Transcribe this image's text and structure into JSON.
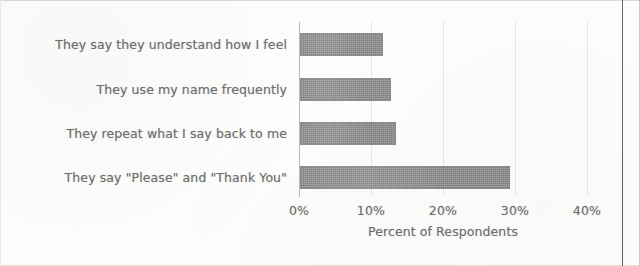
{
  "chart_data": {
    "type": "bar",
    "orientation": "horizontal",
    "title": "",
    "xlabel": "Percent of Respondents",
    "ylabel": "",
    "xlim": [
      0,
      40
    ],
    "xticks": [
      0,
      10,
      20,
      30,
      40
    ],
    "xtick_labels": [
      "0%",
      "10%",
      "20%",
      "30%",
      "40%"
    ],
    "grid": true,
    "legend": false,
    "categories": [
      "They say they understand how I feel",
      "They use my name frequently",
      "They repeat what I say back to me",
      "They say \"Please\" and \"Thank You\""
    ],
    "values": [
      11.5,
      12.6,
      13.3,
      29.2
    ],
    "bar_color": "#8d8d8d",
    "text_color": "#6f6f70",
    "grid_color": "#e7e7e4",
    "axis_color": "#b9b9b7"
  }
}
